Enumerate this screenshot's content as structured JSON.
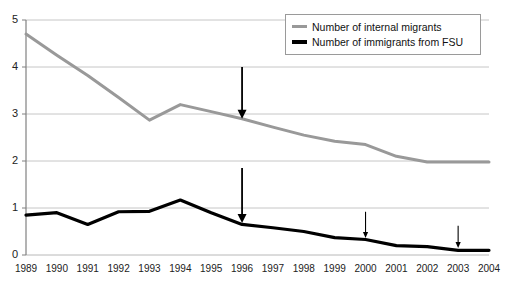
{
  "chart_data": {
    "type": "line",
    "title": "",
    "xlabel": "",
    "ylabel": "",
    "xlim": [
      1989,
      2004
    ],
    "ylim": [
      0,
      5
    ],
    "yticks": [
      0,
      1,
      2,
      3,
      4,
      5
    ],
    "grid": true,
    "legend_position": "top-right",
    "categories": [
      1989,
      1990,
      1991,
      1992,
      1993,
      1994,
      1995,
      1996,
      1997,
      1998,
      1999,
      2000,
      2001,
      2002,
      2003,
      2004
    ],
    "series": [
      {
        "name": "Number of internal migrants",
        "color": "#999999",
        "values": [
          4.7,
          4.25,
          3.82,
          3.35,
          2.87,
          3.2,
          3.05,
          2.9,
          2.72,
          2.55,
          2.42,
          2.35,
          2.1,
          1.98,
          1.98,
          1.98
        ]
      },
      {
        "name": "Number of immigrants from FSU",
        "color": "#000000",
        "values": [
          0.85,
          0.9,
          0.65,
          0.92,
          0.93,
          1.17,
          0.9,
          0.65,
          0.58,
          0.5,
          0.37,
          0.33,
          0.2,
          0.18,
          0.1,
          0.1
        ]
      }
    ],
    "annotations": [
      {
        "label": "arrow-1996-internal",
        "x": 1996,
        "y_start": 4.0,
        "y_end": 2.9,
        "color": "#000000",
        "width": "thick"
      },
      {
        "label": "arrow-1996-fsu",
        "x": 1996,
        "y_start": 1.85,
        "y_end": 0.68,
        "color": "#000000",
        "width": "thick"
      },
      {
        "label": "arrow-2000-fsu",
        "x": 2000,
        "y_start": 0.92,
        "y_end": 0.36,
        "color": "#000000",
        "width": "thin"
      },
      {
        "label": "arrow-2003-fsu",
        "x": 2003,
        "y_start": 0.62,
        "y_end": 0.15,
        "color": "#000000",
        "width": "thin"
      }
    ]
  },
  "legend": {
    "items": [
      {
        "label": "Number of internal migrants",
        "swatch": "gray"
      },
      {
        "label": "Number of immigrants from FSU",
        "swatch": "black"
      }
    ]
  },
  "axis": {
    "y_labels": [
      "5",
      "4",
      "3",
      "2",
      "1",
      "0"
    ],
    "x_labels": [
      "1989",
      "1990",
      "1991",
      "1992",
      "1993",
      "1994",
      "1995",
      "1996",
      "1997",
      "1998",
      "1999",
      "2000",
      "2001",
      "2002",
      "2003",
      "2004"
    ]
  },
  "colors": {
    "internal_migrants": "#999999",
    "fsu_immigrants": "#000000",
    "gridline": "#b8b8b8",
    "axis": "#808080",
    "background": "#ffffff"
  }
}
